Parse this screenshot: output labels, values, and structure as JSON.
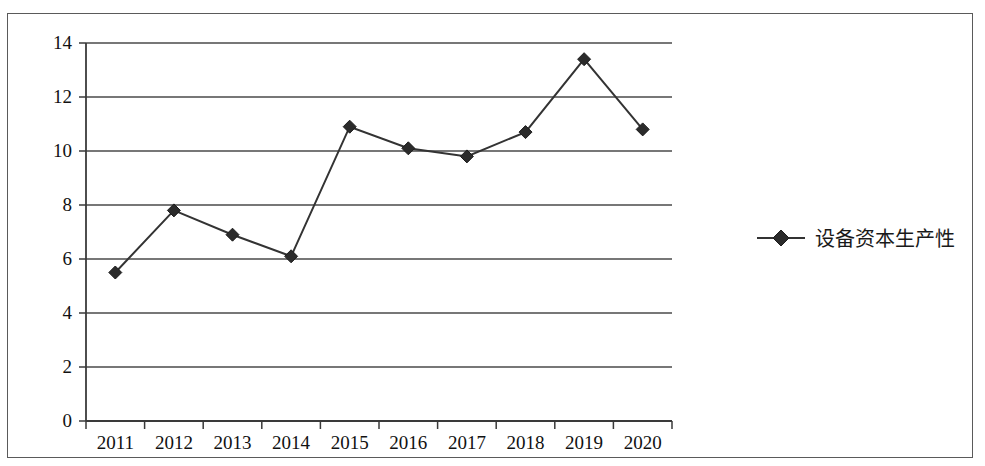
{
  "chart_data": {
    "type": "line",
    "title": "",
    "subtitle": "",
    "xlabel": "",
    "ylabel": "",
    "categories": [
      "2011",
      "2012",
      "2013",
      "2014",
      "2015",
      "2016",
      "2017",
      "2018",
      "2019",
      "2020"
    ],
    "series": [
      {
        "name": "设备资本生产性",
        "values": [
          5.5,
          7.8,
          6.9,
          6.1,
          10.9,
          10.1,
          9.8,
          10.7,
          13.4,
          10.8
        ],
        "marker": "diamond",
        "color": "#333333"
      }
    ],
    "ylim": [
      0,
      14
    ],
    "yticks": [
      0,
      2,
      4,
      6,
      8,
      10,
      12,
      14
    ],
    "ytick_labels": [
      "0",
      "2",
      "4",
      "6",
      "8",
      "10",
      "12",
      "14"
    ],
    "grid": true,
    "grid_axis": "y",
    "legend_position": "right",
    "legend_entries": [
      "设备资本生产性"
    ]
  },
  "legend": {
    "marker_name": "diamond-marker",
    "label": "设备资本生产性"
  },
  "colors": {
    "line": "#333333",
    "marker": "#2b2b2b",
    "grid": "#4a4a4a",
    "axis": "#3a3a3a",
    "frame": "#5a5a5a",
    "background": "#ffffff"
  }
}
